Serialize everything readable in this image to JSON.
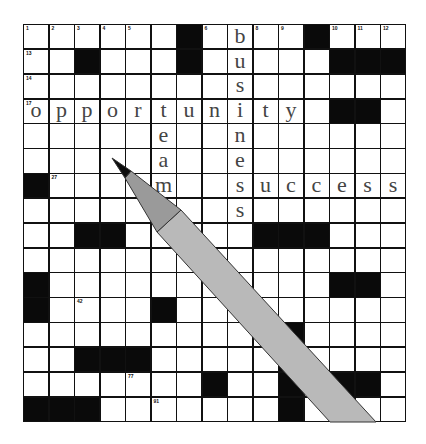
{
  "puzzle": {
    "rows": 16,
    "cols": 15,
    "black_cells": [
      [
        1,
        7
      ],
      [
        1,
        12
      ],
      [
        2,
        3
      ],
      [
        2,
        7
      ],
      [
        2,
        13
      ],
      [
        2,
        14
      ],
      [
        2,
        15
      ],
      [
        4,
        13
      ],
      [
        4,
        14
      ],
      [
        7,
        1
      ],
      [
        9,
        3
      ],
      [
        9,
        4
      ],
      [
        9,
        10
      ],
      [
        9,
        11
      ],
      [
        9,
        12
      ],
      [
        11,
        1
      ],
      [
        11,
        13
      ],
      [
        11,
        14
      ],
      [
        12,
        1
      ],
      [
        12,
        6
      ],
      [
        13,
        11
      ],
      [
        14,
        3
      ],
      [
        14,
        4
      ],
      [
        14,
        5
      ],
      [
        14,
        11
      ],
      [
        15,
        8
      ],
      [
        15,
        11
      ],
      [
        15,
        13
      ],
      [
        15,
        14
      ],
      [
        16,
        1
      ],
      [
        16,
        2
      ],
      [
        16,
        3
      ],
      [
        16,
        11
      ]
    ],
    "numbers": [
      {
        "r": 1,
        "c": 1,
        "n": "1"
      },
      {
        "r": 1,
        "c": 2,
        "n": "2"
      },
      {
        "r": 1,
        "c": 3,
        "n": "3"
      },
      {
        "r": 1,
        "c": 4,
        "n": "4"
      },
      {
        "r": 1,
        "c": 5,
        "n": "5"
      },
      {
        "r": 1,
        "c": 8,
        "n": "6"
      },
      {
        "r": 1,
        "c": 10,
        "n": "8"
      },
      {
        "r": 1,
        "c": 11,
        "n": "9"
      },
      {
        "r": 1,
        "c": 13,
        "n": "10"
      },
      {
        "r": 1,
        "c": 14,
        "n": "11"
      },
      {
        "r": 1,
        "c": 15,
        "n": "12"
      },
      {
        "r": 2,
        "c": 1,
        "n": "13"
      },
      {
        "r": 3,
        "c": 1,
        "n": "14"
      },
      {
        "r": 4,
        "c": 1,
        "n": "17"
      },
      {
        "r": 7,
        "c": 2,
        "n": "27"
      },
      {
        "r": 12,
        "c": 3,
        "n": "42"
      },
      {
        "r": 15,
        "c": 5,
        "n": "77"
      },
      {
        "r": 16,
        "c": 6,
        "n": "91"
      }
    ],
    "words": [
      {
        "word": "opportunity",
        "r": 4,
        "c": 1,
        "dir": "across"
      },
      {
        "word": "business",
        "r": 1,
        "c": 9,
        "dir": "down"
      },
      {
        "word": "team",
        "r": 4,
        "c": 6,
        "dir": "down"
      },
      {
        "word": "success",
        "r": 7,
        "c": 9,
        "dir": "across"
      }
    ]
  },
  "pen": {
    "tip_color": "#0d0d0d",
    "cone_color": "#9a9a9a",
    "barrel_color": "#b9b9b9",
    "outline_color": "#333333"
  }
}
